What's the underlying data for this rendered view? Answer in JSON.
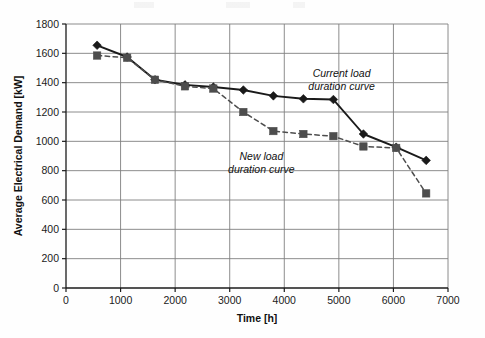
{
  "chart_data": {
    "type": "line",
    "title": "",
    "xlabel": "Time [h]",
    "ylabel": "Average Electrical Demand [kW]",
    "xlim": [
      0,
      7000
    ],
    "ylim": [
      0,
      1800
    ],
    "xticks": [
      0,
      1000,
      2000,
      3000,
      4000,
      5000,
      6000,
      7000
    ],
    "yticks": [
      0,
      200,
      400,
      600,
      800,
      1000,
      1200,
      1400,
      1600,
      1800
    ],
    "xtick_labels": [
      "0",
      "1000",
      "2000",
      "3000",
      "4000",
      "5000",
      "6000",
      "7000"
    ],
    "ytick_labels": [
      "0",
      "200",
      "400",
      "600",
      "800",
      "1000",
      "1200",
      "1400",
      "1600",
      "1800"
    ],
    "grid": true,
    "grid_color": "#808080",
    "legend_position": "inline-annotations",
    "series": [
      {
        "name": "Current load duration curve",
        "marker": "diamond",
        "line_style": "solid",
        "color": "#1a1a1a",
        "x": [
          570,
          1120,
          1630,
          2180,
          2700,
          3250,
          3800,
          4350,
          4900,
          5450,
          6050,
          6600
        ],
        "values": [
          1655,
          1575,
          1420,
          1385,
          1370,
          1350,
          1310,
          1290,
          1285,
          1050,
          960,
          870
        ]
      },
      {
        "name": "New load duration curve",
        "marker": "square",
        "line_style": "dashed",
        "color": "#4d4d4d",
        "x": [
          570,
          1120,
          1630,
          2180,
          2700,
          3250,
          3800,
          4350,
          4900,
          5450,
          6050,
          6600
        ],
        "values": [
          1585,
          1570,
          1420,
          1375,
          1360,
          1200,
          1070,
          1050,
          1035,
          965,
          955,
          645
        ]
      }
    ],
    "annotations": [
      {
        "id": "current-load-annotation",
        "line1": "Current load",
        "line2": "duration curve",
        "x": 5050,
        "y": 1440
      },
      {
        "id": "new-load-annotation",
        "line1": "New load",
        "line2": "duration curve",
        "x": 3580,
        "y": 870
      }
    ]
  },
  "axes": {
    "x_title": "Time [h]",
    "y_title": "Average Electrical Demand [kW]"
  }
}
